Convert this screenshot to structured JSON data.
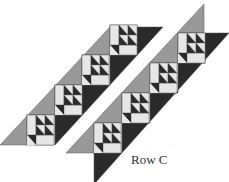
{
  "diagram": {
    "label": "Row C",
    "colors": {
      "background": "#ffffff",
      "light": "#e6e6e6",
      "mid": "#999999",
      "dark": "#2a2a2a",
      "line": "#555555"
    },
    "strips": [
      {
        "name": "strip-left",
        "blocks": 4
      },
      {
        "name": "strip-right",
        "blocks": 4
      }
    ]
  }
}
